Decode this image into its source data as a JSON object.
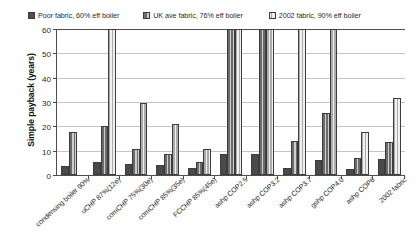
{
  "chart_data": {
    "type": "bar",
    "title": "",
    "xlabel": "",
    "ylabel": "Simple payback (years)",
    "ylim": [
      0,
      60
    ],
    "yticks": [
      0,
      10,
      20,
      30,
      40,
      50,
      60
    ],
    "grid": true,
    "legend_position": "top",
    "clipped_note": "bars reaching 60 are cut off at the top of the axis",
    "categories": [
      "condensing boiler 90%",
      "uCHP 87%(12e)",
      "comCHP 75%(30e)",
      "comCHP 85%(35e)",
      "FCCHP 85%(45e)",
      "ashp COP2.5",
      "ashp COP3.2",
      "ashp COP3.7",
      "gshp COP4.0",
      "ashp COP6",
      "2002 fabric"
    ],
    "series": [
      {
        "name": "Poor fabric, 60% eff boiler",
        "color": "#4a4a4a",
        "values": [
          3.5,
          5.5,
          4.5,
          4,
          3,
          8.5,
          8.5,
          3,
          6,
          2.5,
          6.5
        ]
      },
      {
        "name": "UK ave fabric, 76% eff boiler",
        "color": "#6b6b6b",
        "values": [
          17.5,
          20,
          10.5,
          8.5,
          5.5,
          60,
          60,
          14,
          25.5,
          7,
          13.5
        ]
      },
      {
        "name": "2002 fabric, 90% eff boiler",
        "color": "#ababab",
        "values": [
          null,
          60,
          29.5,
          21,
          10.5,
          60,
          60,
          60,
          60,
          17.5,
          31.5
        ]
      }
    ]
  },
  "legend": {
    "items": [
      {
        "label": "Poor fabric, 60% eff boiler"
      },
      {
        "label": "UK ave fabric, 76% eff boiler"
      },
      {
        "label": "2002 fabric, 90% eff boiler"
      }
    ]
  },
  "axes": {
    "y_title": "Simple payback (years)",
    "y_ticks": [
      "0",
      "10",
      "20",
      "30",
      "40",
      "50",
      "60"
    ]
  }
}
